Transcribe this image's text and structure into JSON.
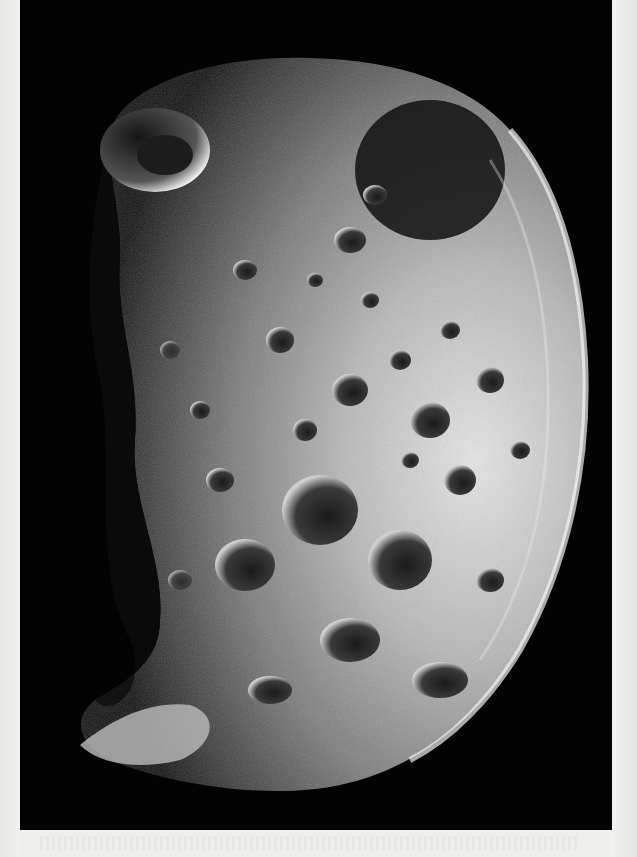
{
  "image": {
    "subject": "cratered moon",
    "description": "Grayscale spacecraft photograph of a heavily cratered, irregular moon lit from the right, on black space background, printed on a light page",
    "colors": {
      "page": "#efefed",
      "space": "#020202",
      "surface_light": "#d8d8d8",
      "surface_mid": "#8a8a8a",
      "surface_dark": "#2a2a2a"
    }
  }
}
